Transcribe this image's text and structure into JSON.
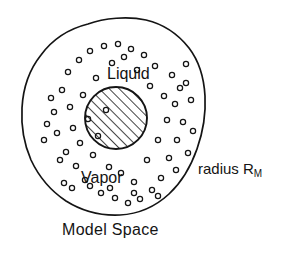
{
  "figure": {
    "background_color": "#ffffff",
    "line_color": "#141414",
    "labels": {
      "liquid": "Liquid",
      "vapor": "Vapor",
      "radius_text": "radius R",
      "radius_subscript": "M",
      "model_space": "Model Space"
    },
    "outer_boundary": {
      "name": "model-space-boundary",
      "shape": "irregular closed blob",
      "style": "open outline, no fill"
    },
    "inner_circle": {
      "name": "liquid-droplet",
      "shape": "circle",
      "fill": "diagonal hatching",
      "center_x": 116,
      "center_y": 118,
      "radius": 31
    },
    "particles": {
      "name": "vapor-molecules",
      "shape": "small open circles",
      "count": 62,
      "radius": 2.6
    }
  },
  "chart_data": {
    "type": "diagram",
    "title": "Model Space",
    "annotations": [
      "Liquid",
      "Vapor",
      "radius R_M",
      "Model Space"
    ],
    "regions": [
      {
        "name": "Liquid",
        "geometry": "hatched circle",
        "cx": 116,
        "cy": 118,
        "r": 31
      },
      {
        "name": "Vapor",
        "geometry": "annulus between droplet and outer boundary"
      },
      {
        "name": "Model Space",
        "geometry": "irregular outer boundary",
        "radius_label": "R_M"
      }
    ],
    "particle_positions": [
      [
        54,
        112
      ],
      [
        57,
        133
      ],
      [
        62,
        90
      ],
      [
        66,
        152
      ],
      [
        68,
        72
      ],
      [
        70,
        107
      ],
      [
        73,
        128
      ],
      [
        76,
        166
      ],
      [
        79,
        60
      ],
      [
        80,
        143
      ],
      [
        83,
        95
      ],
      [
        85,
        180
      ],
      [
        88,
        119
      ],
      [
        90,
        51
      ],
      [
        93,
        155
      ],
      [
        96,
        78
      ],
      [
        98,
        136
      ],
      [
        101,
        193
      ],
      [
        104,
        46
      ],
      [
        106,
        110
      ],
      [
        109,
        167
      ],
      [
        112,
        63
      ],
      [
        115,
        198
      ],
      [
        118,
        44
      ],
      [
        121,
        173
      ],
      [
        124,
        57
      ],
      [
        128,
        203
      ],
      [
        131,
        49
      ],
      [
        134,
        182
      ],
      [
        137,
        70
      ],
      [
        140,
        199
      ],
      [
        144,
        55
      ],
      [
        147,
        160
      ],
      [
        150,
        86
      ],
      [
        152,
        190
      ],
      [
        155,
        66
      ],
      [
        158,
        140
      ],
      [
        161,
        178
      ],
      [
        164,
        96
      ],
      [
        167,
        120
      ],
      [
        169,
        158
      ],
      [
        172,
        75
      ],
      [
        175,
        104
      ],
      [
        177,
        140
      ],
      [
        180,
        88
      ],
      [
        183,
        122
      ],
      [
        186,
        64
      ],
      [
        188,
        153
      ],
      [
        191,
        100
      ],
      [
        193,
        131
      ],
      [
        47,
        124
      ],
      [
        51,
        98
      ],
      [
        60,
        160
      ],
      [
        64,
        183
      ],
      [
        72,
        188
      ],
      [
        90,
        186
      ],
      [
        110,
        188
      ],
      [
        134,
        193
      ],
      [
        158,
        196
      ],
      [
        176,
        170
      ],
      [
        186,
        83
      ],
      [
        44,
        140
      ]
    ]
  }
}
